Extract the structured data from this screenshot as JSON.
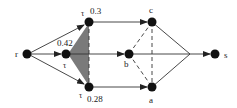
{
  "diagram": {
    "type": "network-flow-graph",
    "colors": {
      "node": "#111111",
      "edge": "#333333",
      "triangle_fill": "#7a7a7a",
      "background": "#ffffff"
    },
    "nodes": {
      "r": {
        "label": "r"
      },
      "tau_top": {
        "label": "τ",
        "value": "0.3"
      },
      "tau_mid": {
        "label": "τ",
        "value": "0.42"
      },
      "tau_bot": {
        "label": "τ",
        "value": "0.28"
      },
      "c": {
        "label": "c"
      },
      "b": {
        "label": "b"
      },
      "a": {
        "label": "a"
      },
      "s": {
        "label": "s"
      }
    },
    "edges": [
      {
        "from": "r",
        "to": "tau_top",
        "style": "solid",
        "arrow": true
      },
      {
        "from": "r",
        "to": "tau_mid",
        "style": "solid",
        "arrow": true
      },
      {
        "from": "r",
        "to": "tau_bot",
        "style": "solid",
        "arrow": true
      },
      {
        "from": "tau_top",
        "to": "c",
        "style": "solid",
        "arrow": true
      },
      {
        "from": "tau_mid",
        "to": "b",
        "style": "solid",
        "arrow": true
      },
      {
        "from": "tau_bot",
        "to": "a",
        "style": "solid",
        "arrow": true
      },
      {
        "from": "tau_top",
        "to": "tau_bot",
        "style": "dashed",
        "arrow": false
      },
      {
        "from": "c",
        "to": "b",
        "style": "dashed",
        "arrow": false
      },
      {
        "from": "b",
        "to": "a",
        "style": "dashed",
        "arrow": false
      },
      {
        "from": "c",
        "to": "a",
        "style": "dashed",
        "arrow": false
      },
      {
        "from": "c",
        "to": "junction",
        "style": "solid",
        "arrow": false
      },
      {
        "from": "a",
        "to": "junction",
        "style": "solid",
        "arrow": false
      },
      {
        "from": "b",
        "to": "junction",
        "style": "solid",
        "arrow": false
      },
      {
        "from": "junction",
        "to": "s",
        "style": "solid",
        "arrow": true
      }
    ],
    "shaded_region": {
      "between": [
        "tau_mid",
        "tau_top",
        "tau_bot"
      ]
    }
  }
}
